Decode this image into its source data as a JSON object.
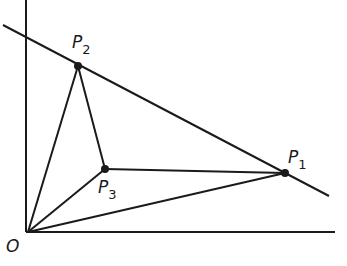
{
  "diagram": {
    "type": "geometric-figure",
    "colors": {
      "ink": "#1a1a1a",
      "background": "#ffffff"
    },
    "origin": {
      "label": "O",
      "x": 28,
      "y": 232
    },
    "axes": {
      "x_axis": {
        "from": [
          26,
          232
        ],
        "to": [
          335,
          232
        ]
      },
      "y_axis": {
        "from": [
          26,
          0
        ],
        "to": [
          26,
          232
        ]
      }
    },
    "line": {
      "from": [
        3,
        25
      ],
      "to": [
        329,
        196
      ]
    },
    "points": [
      {
        "id": "P1",
        "label": "P",
        "subscript": "1",
        "x": 285,
        "y": 173,
        "label_x": 288,
        "label_y": 163
      },
      {
        "id": "P2",
        "label": "P",
        "subscript": "2",
        "x": 78,
        "y": 66,
        "label_x": 72,
        "label_y": 48
      },
      {
        "id": "P3",
        "label": "P",
        "subscript": "3",
        "x": 105,
        "y": 169,
        "label_x": 98,
        "label_y": 193
      }
    ],
    "segments": [
      [
        "O",
        "P1"
      ],
      [
        "O",
        "P2"
      ],
      [
        "O",
        "P3"
      ],
      [
        "P2",
        "P3"
      ],
      [
        "P3",
        "P1"
      ]
    ]
  }
}
